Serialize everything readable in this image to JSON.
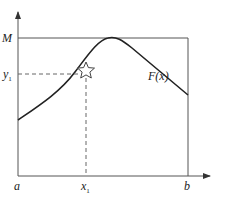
{
  "diagram": {
    "type": "rejection-sampling-illustration",
    "labels": {
      "max": "M",
      "y_sample": "y",
      "y_sample_sub": "1",
      "function": "F(x)",
      "x_left": "a",
      "x_sample": "x",
      "x_sample_sub": "1",
      "x_right": "b"
    },
    "colors": {
      "axis": "#555555",
      "curve": "#222222",
      "box": "#555555",
      "dashed": "#666666",
      "star": "#444444"
    },
    "marker": "star-icon"
  }
}
